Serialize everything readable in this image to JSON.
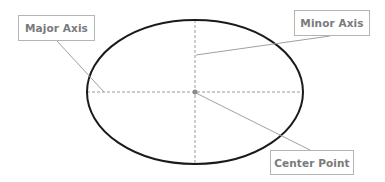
{
  "diagram": {
    "ellipse": {
      "cx": 195,
      "cy": 92,
      "rx": 108,
      "ry": 72,
      "stroke": "#1a1a1a"
    },
    "axes": {
      "stroke": "#9a9a9a"
    },
    "leader_color": "#a0a0a0",
    "labels": {
      "major_axis": "Major Axis",
      "minor_axis": "Minor Axis",
      "center_point": "Center Point"
    }
  }
}
